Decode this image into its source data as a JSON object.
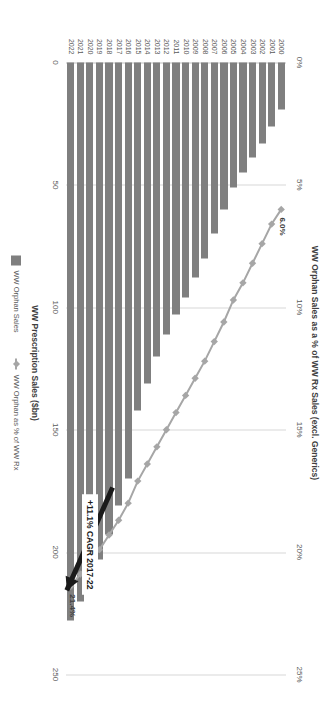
{
  "chart_data": {
    "type": "bar",
    "title": "",
    "subtitle": "",
    "xlabel": "",
    "ylabel": "WW Prescription Sales ($bn)",
    "y2label": "WW Orphan Sales as a % of WW Rx Sales (excl. Generics)",
    "categories": [
      "2000",
      "2001",
      "2002",
      "2003",
      "2004",
      "2005",
      "2006",
      "2007",
      "2008",
      "2009",
      "2010",
      "2011",
      "2012",
      "2013",
      "2014",
      "2015",
      "2016",
      "2017",
      "2018",
      "2019",
      "2020",
      "2021",
      "2022"
    ],
    "ylim": [
      0,
      250
    ],
    "y2lim": [
      0,
      25
    ],
    "grid": true,
    "legend_position": "bottom",
    "yticks": [
      "0",
      "50",
      "100",
      "150",
      "200",
      "250"
    ],
    "ytick_values": [
      0,
      50,
      100,
      150,
      200,
      250
    ],
    "y2ticks": [
      "0%",
      "5%",
      "10%",
      "15%",
      "20%",
      "25%"
    ],
    "y2tick_values": [
      0,
      5,
      10,
      15,
      20,
      25
    ],
    "series": [
      {
        "name": "WW Orphan Sales",
        "type": "bar",
        "color": "#7f7f7f",
        "axis": "primary",
        "values": [
          19,
          26,
          33,
          39,
          45,
          51,
          60,
          70,
          80,
          88,
          96,
          103,
          111,
          120,
          131,
          142,
          170,
          181,
          193,
          203,
          212,
          220,
          228
        ]
      },
      {
        "name": "WW Orphan as % of WW Rx",
        "type": "line",
        "color": "#a6a6a6",
        "axis": "secondary",
        "values": [
          6.0,
          6.6,
          7.4,
          8.2,
          9.0,
          9.7,
          10.6,
          11.4,
          12.2,
          12.9,
          13.6,
          14.3,
          15.0,
          15.7,
          16.4,
          17.1,
          18.0,
          18.7,
          19.3,
          19.9,
          20.4,
          20.9,
          21.4
        ]
      }
    ],
    "data_labels": [
      {
        "text": "6.0%",
        "category": "2000",
        "series": "WW Orphan as % of WW Rx"
      },
      {
        "text": "21.4%",
        "category": "2022",
        "series": "WW Orphan as % of WW Rx"
      }
    ],
    "annotations": [
      {
        "text": "+11.1% CAGR 2017-22",
        "type": "callout-arrow",
        "from_category": "2017",
        "to_category": "2022",
        "color": "#1a1a1a"
      }
    ]
  },
  "colors": {
    "bar": "#7f7f7f",
    "line": "#a6a6a6",
    "grid": "#d7d7d7",
    "text": "#595959",
    "annotation": "#1a1a1a",
    "background": "#ffffff"
  },
  "legend": {
    "items": [
      {
        "label": "WW Orphan Sales",
        "marker": "square-swatch"
      },
      {
        "label": "WW Orphan as % of WW Rx",
        "marker": "line-diamond-marker"
      }
    ]
  },
  "axis_titles": {
    "primary": "WW Prescription Sales ($bn)",
    "secondary": "WW Orphan Sales as a % of WW Rx Sales (excl. Generics)"
  },
  "annotation": {
    "cagr_label": "+11.1% CAGR 2017-22"
  }
}
